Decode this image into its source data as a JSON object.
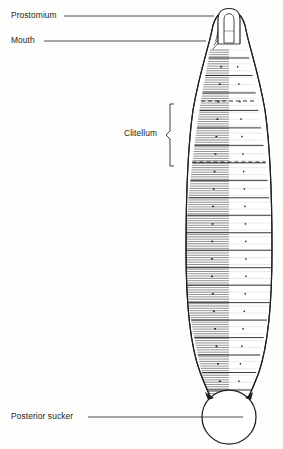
{
  "figure": {
    "view": "dorsal whole-body",
    "canvas": {
      "width": 283,
      "height": 449
    },
    "background_color": "#fdfdfc",
    "ink_color": "#231f20",
    "text_color": "#231f20"
  },
  "labels": {
    "prostomium": "Prostomium",
    "mouth": "Mouth",
    "clitellum": "Clitellum",
    "posterior_sucker": "Posterior sucker"
  },
  "leaders": {
    "prostomium": {
      "text_end_x": 64,
      "y": 16,
      "target_x": 214
    },
    "mouth": {
      "text_end_x": 44,
      "y": 41,
      "target_x": 206
    },
    "posterior_sucker": {
      "text_end_x": 88,
      "y": 417,
      "target_x": 243
    }
  },
  "brace": {
    "name": "clitellum-brace",
    "x": 172,
    "top_y": 104,
    "bottom_y": 166,
    "tip_x": 166,
    "label_gap_x": 161
  },
  "body": {
    "head_apex_y": 14,
    "tail_y": 398,
    "widest_y": 268,
    "left_x": 186,
    "right_x": 272,
    "neck_left_x": 212,
    "neck_right_x": 246,
    "tail_left_x": 210,
    "tail_right_x": 250,
    "outline_color": "#231f20",
    "fill_color": "#ffffff"
  },
  "prostomium_lobe": {
    "center_x": 229,
    "top_y": 9,
    "bottom_y": 44,
    "half_width": 11,
    "inner_top_y": 14,
    "inner_bottom_y": 42,
    "inner_half_width": 6
  },
  "mouth_striations": {
    "count": 7,
    "top_y": 22,
    "bottom_y": 46,
    "side": "left",
    "note": "oblique lines on the left of the head converging toward mouth"
  },
  "annuli": {
    "total_lines": 150,
    "shaded_half": "left",
    "note": "dense horizontal annulation lines; left half drawn dark, right half mostly blank"
  },
  "segments": {
    "count": 20,
    "band_spacing_px": 19,
    "first_band_y": 58,
    "last_band_y": 390,
    "dot_count_per_band": 2,
    "note": "each segment band separated by a solid transverse line with small sensory papillae dots"
  },
  "clitellum_markers": {
    "dashed_lines": [
      {
        "name": "clitellum-anterior-boundary",
        "y": 101
      },
      {
        "name": "clitellum-posterior-boundary",
        "y": 162
      }
    ],
    "dash_pattern": "4 3"
  },
  "posterior_sucker": {
    "center_x": 229,
    "center_y": 417,
    "radius": 27,
    "outline_color": "#231f20",
    "fill_color": "#ffffff"
  },
  "chart_data": {
    "type": "diagram",
    "annotations": [
      {
        "label": "Prostomium",
        "points_to": "anterior head lobe"
      },
      {
        "label": "Mouth",
        "points_to": "oral striated region below prostomium"
      },
      {
        "label": "Clitellum",
        "points_to": "glandular band between the two dashed transverse lines"
      },
      {
        "label": "Posterior sucker",
        "points_to": "circular disc at the caudal end"
      }
    ]
  }
}
